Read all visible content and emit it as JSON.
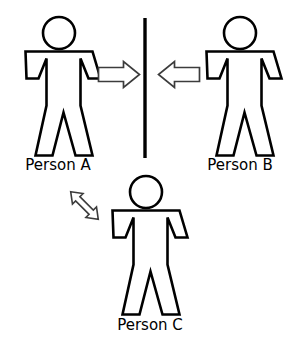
{
  "diagram": {
    "title": "",
    "background_color": "#ffffff",
    "stroke_color": "#000000",
    "arrow_stroke_color": "#3c3c3c",
    "arrow_fill_color": "#ffffff",
    "figures": [
      {
        "id": "person-a",
        "label": "Person A",
        "icon": "person-figure-icon",
        "position": "left"
      },
      {
        "id": "person-b",
        "label": "Person B",
        "icon": "person-figure-icon",
        "position": "right"
      },
      {
        "id": "person-c",
        "label": "Person C",
        "icon": "person-figure-icon",
        "position": "bottom-center"
      }
    ],
    "connectors": [
      {
        "id": "arrow-a-to-barrier",
        "icon": "block-arrow-right-icon",
        "direction": "right",
        "from": "Person A",
        "to": "barrier"
      },
      {
        "id": "arrow-b-to-barrier",
        "icon": "block-arrow-left-icon",
        "direction": "left",
        "from": "Person B",
        "to": "barrier"
      },
      {
        "id": "arrow-a-to-c",
        "icon": "double-headed-arrow-icon",
        "direction": "bidirectional",
        "from": "Person A",
        "to": "Person C"
      }
    ],
    "barrier": {
      "id": "vertical-barrier",
      "icon": "vertical-line-icon",
      "label": ""
    }
  }
}
